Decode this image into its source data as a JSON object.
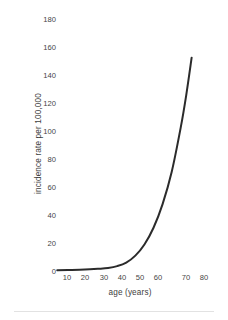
{
  "chart_data": {
    "type": "line",
    "title": "",
    "xlabel": "age (years)",
    "ylabel": "incidence rate per 100,000",
    "xlim": [
      0,
      85
    ],
    "ylim": [
      0,
      180
    ],
    "xticks": [
      10,
      20,
      30,
      40,
      50,
      60,
      70,
      80
    ],
    "xtick_labels": [
      "10",
      "20",
      "30",
      "40",
      "50",
      "60",
      "70",
      "80"
    ],
    "yticks": [
      0,
      20,
      40,
      60,
      80,
      100,
      120,
      140,
      160,
      180
    ],
    "ytick_labels": [
      "0",
      "20",
      "40",
      "60",
      "80",
      "100",
      "120",
      "140",
      "160",
      "180"
    ],
    "grid": false,
    "legend": false,
    "series": [
      {
        "name": "incidence rate",
        "color": "#2b2b2b",
        "x": [
          2,
          10,
          20,
          25,
          30,
          35,
          40,
          45,
          50,
          55,
          60,
          65,
          70,
          73,
          76
        ],
        "values": [
          0.5,
          0.8,
          1.2,
          1.6,
          2.2,
          3.5,
          6.0,
          11.0,
          19.0,
          31.0,
          48.0,
          71.0,
          103.0,
          126.0,
          153.0
        ]
      }
    ]
  }
}
